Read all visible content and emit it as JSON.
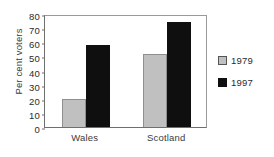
{
  "chart_data": {
    "type": "bar",
    "title": "",
    "xlabel": "",
    "ylabel": "Per cent voters",
    "categories": [
      "Wales",
      "Scotland"
    ],
    "series": [
      {
        "name": "1979",
        "color": "#c0c0c0",
        "values": [
          20,
          52
        ]
      },
      {
        "name": "1997",
        "color": "#0f0f0f",
        "values": [
          58,
          74
        ]
      }
    ],
    "ylim": [
      0,
      80
    ],
    "ytick_labels": [
      "80",
      "70",
      "60",
      "50",
      "40",
      "30",
      "20",
      "10",
      "0"
    ],
    "ytick_values": [
      80,
      70,
      60,
      50,
      40,
      30,
      20,
      10,
      0
    ],
    "grid": false,
    "legend_position": "right"
  },
  "legend": {
    "items": [
      {
        "label": "1979"
      },
      {
        "label": "1997"
      }
    ]
  }
}
